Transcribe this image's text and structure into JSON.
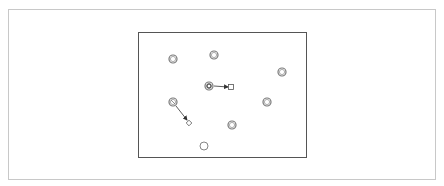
{
  "diagram": {
    "frame": {
      "x": 8,
      "y": 9,
      "w": 428,
      "h": 171,
      "stroke": "#c8c8c8"
    },
    "canvas": {
      "x": 138,
      "y": 32,
      "w": 168,
      "h": 125,
      "stroke": "#555555"
    },
    "nodes": [
      {
        "id": "n1",
        "type": "double-circle",
        "cx": 173,
        "cy": 59
      },
      {
        "id": "n2",
        "type": "double-circle",
        "cx": 214,
        "cy": 55
      },
      {
        "id": "n3",
        "type": "double-circle",
        "cx": 282,
        "cy": 72
      },
      {
        "id": "n4",
        "type": "double-circle-bold",
        "cx": 209,
        "cy": 86
      },
      {
        "id": "n5",
        "type": "double-circle-crossed",
        "cx": 173,
        "cy": 102
      },
      {
        "id": "n6",
        "type": "double-circle",
        "cx": 267,
        "cy": 102
      },
      {
        "id": "n7",
        "type": "double-circle",
        "cx": 232,
        "cy": 125
      },
      {
        "id": "n8",
        "type": "circle",
        "cx": 204,
        "cy": 146
      },
      {
        "id": "t1",
        "type": "square",
        "cx": 231,
        "cy": 87
      },
      {
        "id": "t2",
        "type": "diamond",
        "cx": 189,
        "cy": 123
      }
    ],
    "edges": [
      {
        "from": "n4",
        "to": "t1",
        "x1": 214,
        "y1": 86,
        "x2": 228,
        "y2": 87
      },
      {
        "from": "n5",
        "to": "t2",
        "x1": 176,
        "y1": 106,
        "x2": 187,
        "y2": 120
      }
    ]
  }
}
